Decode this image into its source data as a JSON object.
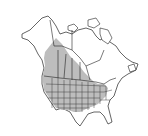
{
  "map": {
    "type": "species-range-map",
    "region": "North America",
    "colors": {
      "background": "#ffffff",
      "land": "#ffffff",
      "outline": "#222222",
      "range_fill": "#bdbdbd"
    },
    "range_description": "Shaded range covering western and central United States, southern Canadian prairies and British Columbia, extending north-west into the Northwest Territories; excludes southeastern US, Texas Gulf coast and Florida."
  }
}
